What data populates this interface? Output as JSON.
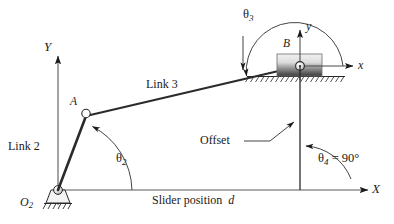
{
  "figure": {
    "type": "engineering-mechanism-diagram",
    "colors": {
      "line": "#1a1a1a",
      "axis": "#555555",
      "link": "#2b2b2b",
      "slider_light": "#e8e8e8",
      "slider_dark": "#4a4a4a",
      "background": "#ffffff"
    }
  },
  "labels": {
    "global_y_axis": "Y",
    "global_x_axis": "X",
    "local_y_axis": "y",
    "local_x_axis": "x",
    "origin": "O",
    "origin_sub": "2",
    "joint_a": "A",
    "joint_b": "B",
    "link2": "Link 2",
    "link3": "Link 3",
    "theta2": "θ",
    "theta2_sub": "2",
    "theta3": "θ",
    "theta3_sub": "3",
    "theta4": "θ",
    "theta4_sub": "4",
    "theta4_value": " = 90°",
    "offset": "Offset",
    "slider_position": "Slider position",
    "slider_position_var": "d"
  },
  "geometry": {
    "origin_point": [
      58,
      190
    ],
    "joint_a_point": [
      86,
      116
    ],
    "joint_b_point": [
      300,
      66
    ],
    "global_x_axis_y": 190,
    "global_y_axis_x": 58,
    "offset_line_x": 300,
    "theta4_degrees": 90
  }
}
